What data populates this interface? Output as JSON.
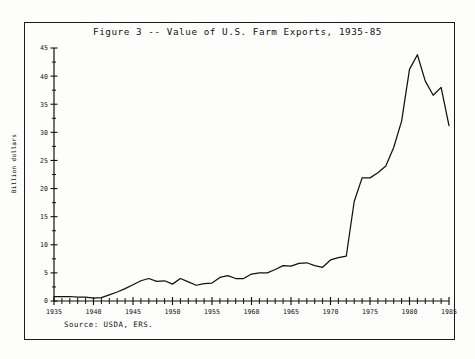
{
  "figure": {
    "title": "Figure 3 -- Value of U.S. Farm Exports, 1935-85",
    "source_note": "Source:  USDA, ERS.",
    "ylabel": "Billion dollars"
  },
  "chart_data": {
    "type": "line",
    "title": "Figure 3 -- Value of U.S. Farm Exports, 1935-85",
    "xlabel": "",
    "ylabel": "Billion dollars",
    "xlim": [
      1935,
      1985
    ],
    "ylim": [
      0,
      45
    ],
    "grid": false,
    "legend": null,
    "x_major_ticks": [
      1935,
      1940,
      1945,
      1950,
      1955,
      1960,
      1965,
      1970,
      1975,
      1980,
      1985
    ],
    "x_minor_tick_step": 1,
    "y_major_ticks": [
      0,
      5,
      10,
      15,
      20,
      25,
      30,
      35,
      40,
      45
    ],
    "y_minor_tick_step": 2.5,
    "x_tick_labels": [
      "1935",
      "1940",
      "1945",
      "1950",
      "1955",
      "1960",
      "1965",
      "1970",
      "1975",
      "1980",
      "1985"
    ],
    "y_tick_labels": [
      "0",
      "5",
      "10",
      "15",
      "20",
      "25",
      "30",
      "35",
      "40",
      "45"
    ],
    "annotations": [
      "Source:  USDA, ERS."
    ],
    "series": [
      {
        "name": "Value of U.S. farm exports",
        "x": [
          1935,
          1936,
          1937,
          1938,
          1939,
          1940,
          1941,
          1942,
          1943,
          1944,
          1945,
          1946,
          1947,
          1948,
          1949,
          1950,
          1951,
          1952,
          1953,
          1954,
          1955,
          1956,
          1957,
          1958,
          1959,
          1960,
          1961,
          1962,
          1963,
          1964,
          1965,
          1966,
          1967,
          1968,
          1969,
          1970,
          1971,
          1972,
          1973,
          1974,
          1975,
          1976,
          1977,
          1978,
          1979,
          1980,
          1981,
          1982,
          1983,
          1984,
          1985
        ],
        "values": [
          0.8,
          0.8,
          0.8,
          0.7,
          0.7,
          0.5,
          0.6,
          1.1,
          1.6,
          2.2,
          2.9,
          3.6,
          4.0,
          3.5,
          3.6,
          3.0,
          4.0,
          3.4,
          2.8,
          3.1,
          3.2,
          4.2,
          4.5,
          4.0,
          4.0,
          4.8,
          5.0,
          5.0,
          5.6,
          6.3,
          6.2,
          6.7,
          6.8,
          6.3,
          6.0,
          7.3,
          7.7,
          8.0,
          17.7,
          21.9,
          21.9,
          22.8,
          24.0,
          27.3,
          32.0,
          41.2,
          43.8,
          39.1,
          36.6,
          38.0,
          31.2
        ]
      }
    ]
  }
}
